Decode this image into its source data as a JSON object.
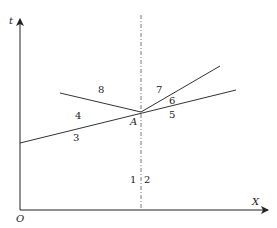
{
  "diagram": {
    "axes": {
      "y_label": "t",
      "x_label": "X",
      "origin_label": "O"
    },
    "point_label": "A",
    "region_labels": [
      "1",
      "2",
      "3",
      "4",
      "5",
      "6",
      "7",
      "8"
    ],
    "colors": {
      "line": "#333333",
      "axis": "#222222",
      "background": "#ffffff"
    }
  }
}
